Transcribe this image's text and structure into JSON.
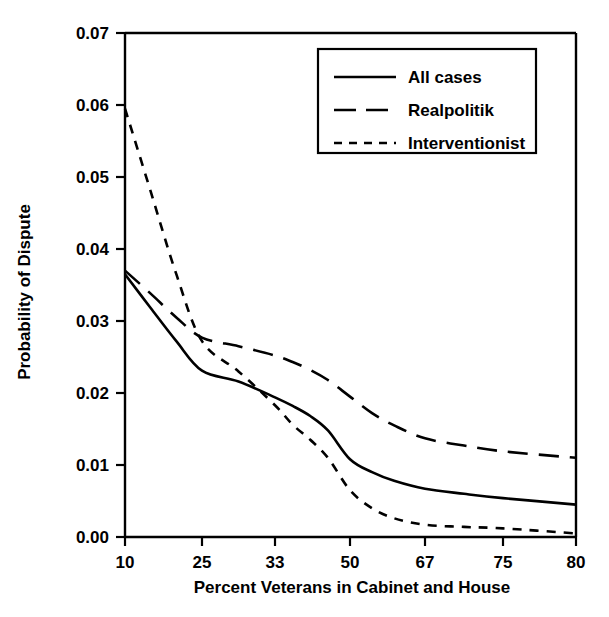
{
  "chart_data": {
    "type": "line",
    "title": "",
    "xlabel": "Percent Veterans in Cabinet and House",
    "ylabel": "Probability of Dispute",
    "xlim": [
      10,
      80
    ],
    "ylim": [
      0.0,
      0.07
    ],
    "grid": false,
    "legend_position": "top-right",
    "xticks": [
      10,
      25,
      33,
      50,
      67,
      75,
      80
    ],
    "xtick_labels": [
      "10",
      "25",
      "33",
      "50",
      "67",
      "75",
      "80"
    ],
    "xtick_positions_px": [
      125,
      202,
      275,
      350,
      425,
      503,
      576
    ],
    "yticks": [
      0.0,
      0.01,
      0.02,
      0.03,
      0.04,
      0.05,
      0.06,
      0.07
    ],
    "ytick_labels": [
      "0.00",
      "0.01",
      "0.02",
      "0.03",
      "0.04",
      "0.05",
      "0.06",
      "0.07"
    ],
    "x": [
      10,
      15,
      20,
      25,
      29,
      33,
      37,
      41,
      45,
      50,
      55,
      60,
      67,
      71,
      75,
      80
    ],
    "series": [
      {
        "name": "All cases",
        "style": "solid",
        "values": [
          0.0365,
          0.0318,
          0.0272,
          0.0231,
          0.0216,
          0.0194,
          0.0182,
          0.0168,
          0.0148,
          0.0108,
          0.009,
          0.0078,
          0.0067,
          0.006,
          0.0054,
          0.0045
        ]
      },
      {
        "name": "Realpolitik",
        "style": "long-dash",
        "values": [
          0.037,
          0.0338,
          0.0305,
          0.0277,
          0.0265,
          0.0252,
          0.0243,
          0.0232,
          0.0218,
          0.0195,
          0.0172,
          0.0155,
          0.0137,
          0.0127,
          0.0119,
          0.011
        ]
      },
      {
        "name": "Interventionist",
        "style": "short-dash",
        "values": [
          0.0595,
          0.048,
          0.0365,
          0.0272,
          0.023,
          0.0183,
          0.0156,
          0.0135,
          0.011,
          0.0065,
          0.004,
          0.0026,
          0.0017,
          0.0014,
          0.0012,
          0.0005
        ]
      }
    ]
  },
  "legend": {
    "entries": [
      {
        "label": "All cases",
        "style": "solid"
      },
      {
        "label": "Realpolitik",
        "style": "long-dash"
      },
      {
        "label": "Interventionist",
        "style": "short-dash"
      }
    ]
  },
  "axes": {
    "y_title": "Probability of Dispute",
    "x_title": "Percent Veterans in Cabinet and House"
  },
  "colors": {
    "ink": "#000000",
    "background": "#ffffff"
  }
}
